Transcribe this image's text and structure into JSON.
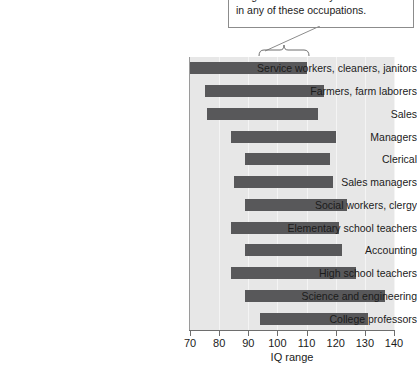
{
  "callout": {
    "lines": [
      "range of 95–110 may be found",
      "in any of these occupations."
    ],
    "bracket_from": 95,
    "bracket_to": 110,
    "leader_icon": "leader-line-icon",
    "bracket_icon": "curly-brace-icon"
  },
  "chart_data": {
    "type": "bar",
    "orientation": "horizontal",
    "subtype": "range-bar",
    "title": "",
    "xlabel": "IQ range",
    "ylabel": "",
    "xlim": [
      70,
      140
    ],
    "xticks": [
      70,
      80,
      90,
      100,
      110,
      120,
      130,
      140
    ],
    "xtick_labels": [
      "70",
      "80",
      "90",
      "100",
      "110",
      "120",
      "130",
      "140"
    ],
    "grid": true,
    "grid_axis": "x",
    "legend": null,
    "bar_color": "#58585a",
    "plot_bg": "#e7e7e7",
    "categories": [
      "Service workers, cleaners, janitors",
      "Farmers, farm laborers",
      "Sales",
      "Managers",
      "Clerical",
      "Sales managers",
      "Social workers, clergy",
      "Elementary school teachers",
      "Accounting",
      "High school teachers",
      "Science and engineering",
      "College professors"
    ],
    "ranges": [
      {
        "category": "Service workers, cleaners, janitors",
        "low": 70,
        "high": 110
      },
      {
        "category": "Farmers, farm laborers",
        "low": 75,
        "high": 116
      },
      {
        "category": "Sales",
        "low": 76,
        "high": 114
      },
      {
        "category": "Managers",
        "low": 84,
        "high": 120
      },
      {
        "category": "Clerical",
        "low": 89,
        "high": 118
      },
      {
        "category": "Sales managers",
        "low": 85,
        "high": 119
      },
      {
        "category": "Social workers, clergy",
        "low": 89,
        "high": 124
      },
      {
        "category": "Elementary school teachers",
        "low": 84,
        "high": 121
      },
      {
        "category": "Accounting",
        "low": 89,
        "high": 122
      },
      {
        "category": "High school teachers",
        "low": 84,
        "high": 127
      },
      {
        "category": "Science and engineering",
        "low": 89,
        "high": 137
      },
      {
        "category": "College professors",
        "low": 94,
        "high": 131
      }
    ]
  }
}
